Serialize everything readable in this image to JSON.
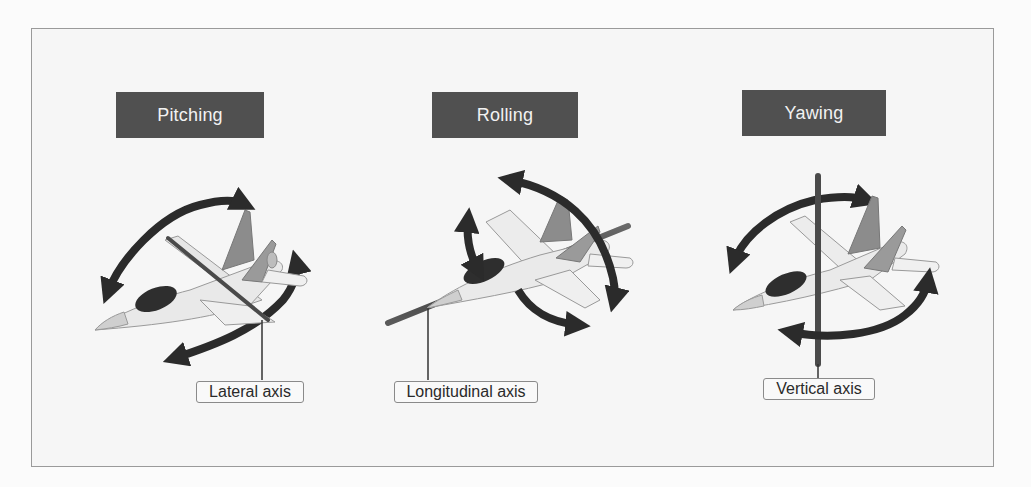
{
  "diagram": {
    "panels": [
      {
        "id": "pitching",
        "title": "Pitching",
        "axis_label": "Lateral axis",
        "motion": "rotation about lateral axis"
      },
      {
        "id": "rolling",
        "title": "Rolling",
        "axis_label": "Longitudinal axis",
        "motion": "rotation about longitudinal axis"
      },
      {
        "id": "yawing",
        "title": "Yawing",
        "axis_label": "Vertical axis",
        "motion": "rotation about vertical axis"
      }
    ],
    "colors": {
      "title_box": "#505050",
      "title_text": "#f2f2f2",
      "arrow": "#2b2b2b",
      "axis_rod": "#4a4a4a",
      "plane_body": "#e8e8e8",
      "plane_dark": "#2e2e2e",
      "fin": "#8c8c8c",
      "frame_border": "#9a9a9a",
      "background": "#f6f6f6"
    },
    "icons": [
      "jet-plane-icon",
      "curved-double-arrow-icon",
      "axis-rod-icon"
    ]
  }
}
